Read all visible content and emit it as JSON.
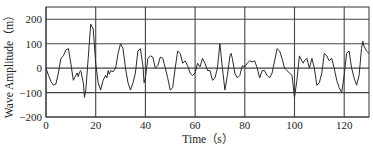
{
  "chart_data": {
    "type": "line",
    "title": "",
    "xlabel": "Time（s）",
    "ylabel": "Wave Amplitude（m）",
    "xlim": [
      0,
      130
    ],
    "ylim": [
      -200,
      250
    ],
    "xticks": [
      0,
      20,
      40,
      60,
      80,
      100,
      120
    ],
    "yticks": [
      -200,
      -100,
      0,
      100,
      200
    ],
    "xtick_labels": [
      "0",
      "20",
      "40",
      "60",
      "80",
      "100",
      "120"
    ],
    "ytick_labels": [
      "−200",
      "−100",
      "0",
      "100",
      "200"
    ],
    "grid": true,
    "legend": null,
    "colors": {
      "line": "#2a2a2a",
      "grid": "#444444",
      "frame": "#333333"
    },
    "series": [
      {
        "name": "Wave Amplitude",
        "x": [
          0,
          1,
          2,
          3,
          4,
          5,
          6,
          7,
          8,
          9,
          10,
          11,
          12,
          12.5,
          13,
          13.5,
          14,
          15,
          15.5,
          16,
          17,
          18,
          19,
          20,
          21,
          22,
          23,
          24,
          24.5,
          25,
          25.5,
          26,
          27,
          28,
          29,
          30,
          31,
          32,
          33,
          34,
          35,
          36,
          37,
          38,
          39,
          39.5,
          40,
          41,
          42,
          43,
          44,
          45,
          46,
          47,
          48,
          49,
          50,
          51,
          52,
          53,
          54,
          55,
          56,
          57,
          58,
          59,
          60,
          61,
          62,
          63,
          64,
          65,
          66,
          67,
          68,
          69,
          70,
          71,
          72,
          73,
          74,
          74.5,
          75,
          76,
          77,
          78,
          79,
          80,
          81,
          82,
          83,
          84,
          85,
          86,
          87,
          88,
          89,
          90,
          91,
          92,
          93,
          94,
          95,
          96,
          97,
          98,
          99,
          100,
          101,
          102,
          103,
          103.5,
          104,
          105,
          105.5,
          106,
          107,
          108,
          109,
          110,
          111,
          112,
          113,
          114,
          115,
          116,
          117,
          118,
          119,
          120,
          121,
          122,
          123,
          124,
          125,
          126,
          127,
          127.5,
          128,
          129,
          130
        ],
        "y": [
          0,
          -30,
          -55,
          -70,
          -65,
          -20,
          40,
          50,
          75,
          80,
          20,
          -50,
          -30,
          -20,
          -35,
          -15,
          -10,
          -60,
          -120,
          -90,
          40,
          180,
          160,
          20,
          -60,
          -90,
          -50,
          -30,
          -40,
          -10,
          -25,
          -10,
          -15,
          0,
          60,
          100,
          80,
          0,
          -60,
          -90,
          -60,
          -20,
          70,
          80,
          10,
          -60,
          -40,
          40,
          50,
          45,
          0,
          10,
          45,
          40,
          0,
          -40,
          -90,
          -80,
          0,
          70,
          60,
          20,
          30,
          10,
          -20,
          -30,
          -20,
          20,
          5,
          40,
          20,
          -10,
          -10,
          -50,
          -40,
          0,
          100,
          0,
          -90,
          -30,
          50,
          60,
          40,
          -20,
          -40,
          -30,
          10,
          5,
          20,
          30,
          25,
          30,
          0,
          -40,
          -10,
          -10,
          -30,
          -40,
          -20,
          30,
          80,
          70,
          40,
          0,
          -10,
          -20,
          -30,
          -120,
          -50,
          50,
          30,
          20,
          30,
          40,
          20,
          0,
          40,
          0,
          -70,
          -60,
          -20,
          60,
          50,
          30,
          40,
          0,
          -50,
          -80,
          -100,
          -30,
          60,
          70,
          0,
          -40,
          -70,
          -30,
          80,
          110,
          90,
          70,
          60
        ]
      }
    ]
  }
}
